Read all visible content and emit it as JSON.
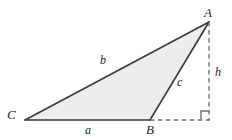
{
  "figure": {
    "type": "geometry-diagram",
    "background_color": "#ffffff",
    "fill_color": "#ededed",
    "stroke_color": "#3a3a3a",
    "dash_color": "#6f6f6f",
    "label_color": "#231f20"
  },
  "vertices": [
    {
      "id": "A",
      "label": "A",
      "x": 209,
      "y": 22,
      "label_x": 204,
      "label_y": 6
    },
    {
      "id": "B",
      "label": "B",
      "x": 150,
      "y": 120,
      "label_x": 146,
      "label_y": 123
    },
    {
      "id": "C",
      "label": "C",
      "x": 25,
      "y": 120,
      "label_x": 7,
      "label_y": 108
    }
  ],
  "sides": [
    {
      "id": "a",
      "label": "a",
      "from": "C",
      "to": "B",
      "label_x": 85,
      "label_y": 124
    },
    {
      "id": "b",
      "label": "b",
      "from": "C",
      "to": "A",
      "label_x": 100,
      "label_y": 54
    },
    {
      "id": "c",
      "label": "c",
      "from": "B",
      "to": "A",
      "label_x": 177,
      "label_y": 76
    }
  ],
  "altitude": {
    "id": "h",
    "label": "h",
    "from_x": 209,
    "from_y": 22,
    "to_x": 209,
    "to_y": 120,
    "label_x": 215,
    "label_y": 66
  },
  "base_extension": {
    "from_x": 150,
    "from_y": 120,
    "to_x": 209,
    "to_y": 120
  },
  "right_angle_marker": {
    "x": 201,
    "y": 111,
    "size": 8,
    "corner_x": 209,
    "corner_y": 119
  }
}
